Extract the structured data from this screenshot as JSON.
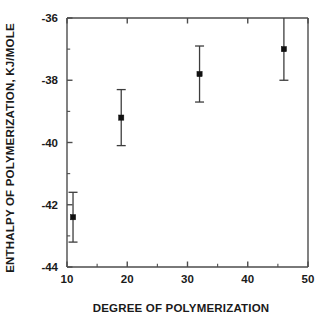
{
  "chart_data": {
    "type": "scatter",
    "title": "",
    "xlabel": "DEGREE OF POLYMERIZATION",
    "ylabel": "ENTHALPY OF POLYMERIZATION, KJ/MOLE",
    "xlim": [
      10,
      50
    ],
    "ylim": [
      -44,
      -36
    ],
    "xticks": [
      10,
      20,
      30,
      40,
      50
    ],
    "xticklabels": [
      "10",
      "20",
      "30",
      "40",
      "50"
    ],
    "xminorticks": [
      15,
      25,
      35,
      45
    ],
    "yticks": [
      -44,
      -42,
      -40,
      -38,
      -36
    ],
    "yticklabels": [
      "-44",
      "-42",
      "-40",
      "-38",
      "-36"
    ],
    "yminorticks": [
      -43,
      -41,
      -39,
      -37
    ],
    "grid": false,
    "legend": null,
    "marker_style": "filled-square",
    "error_bars": "vertical-with-caps",
    "points": [
      {
        "x": 11,
        "y": -42.4,
        "yerr": 0.8
      },
      {
        "x": 19,
        "y": -39.2,
        "yerr": 0.9
      },
      {
        "x": 32,
        "y": -37.8,
        "yerr": 0.9
      },
      {
        "x": 46,
        "y": -37.0,
        "yerr": 1.0
      }
    ],
    "series": [
      {
        "name": "enthalpy of polymerization",
        "x": [
          11,
          19,
          32,
          46
        ],
        "values": [
          -42.4,
          -39.2,
          -37.8,
          -37.0
        ],
        "yerr": [
          0.8,
          0.9,
          0.9,
          1.0
        ]
      }
    ],
    "colors": {
      "marker": "#111111",
      "errorbar": "#3d3d3d",
      "axis": "#4d4d4d",
      "text": "#1a1a1a",
      "background": "#ffffff"
    }
  }
}
